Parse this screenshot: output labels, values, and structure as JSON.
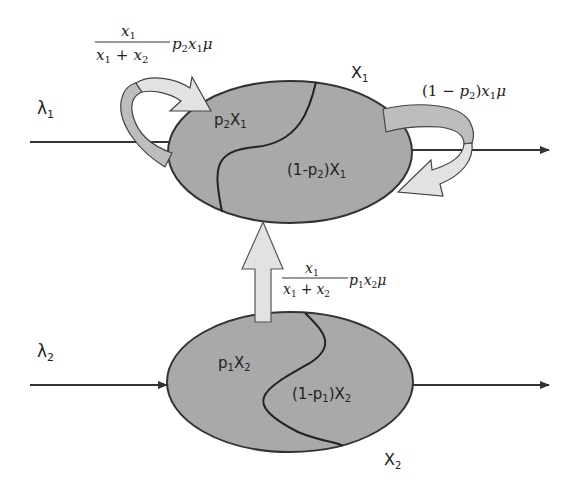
{
  "diagram": {
    "colors": {
      "background": "#ffffff",
      "ellipse_fill": "#a9a9a9",
      "ellipse_stroke": "#333333",
      "arrow_fill_light": "#e2e2e2",
      "arrow_fill_mid": "#bdbdbd",
      "line": "#333333",
      "text": "#222222"
    },
    "queue1": {
      "name": "X",
      "name_sub": "1",
      "arrival_rate": "λ",
      "arrival_sub": "1",
      "region_left": {
        "prefix": "p",
        "prefix_sub": "2",
        "var": "X",
        "var_sub": "1"
      },
      "region_right": {
        "open": "(1-p",
        "p_sub": "2",
        "close": ")X",
        "var_sub": "1"
      }
    },
    "queue2": {
      "name": "X",
      "name_sub": "2",
      "arrival_rate": "λ",
      "arrival_sub": "2",
      "region_left": {
        "prefix": "p",
        "prefix_sub": "1",
        "var": "X",
        "var_sub": "2"
      },
      "region_right": {
        "open": "(1-p",
        "p_sub": "1",
        "close": ")X",
        "var_sub": "2"
      }
    },
    "rates": {
      "self_loop_1": {
        "numerator": "x",
        "numerator_sub": "1",
        "denominator_a": "x",
        "denominator_a_sub": "1",
        "plus": "+",
        "denominator_b": "x",
        "denominator_b_sub": "2",
        "tail_p": "p",
        "tail_p_sub": "2",
        "tail_x": "x",
        "tail_x_sub": "1",
        "tail_mu": "μ"
      },
      "exit_loop_1": {
        "open": "(1 − ",
        "p": "p",
        "p_sub": "2",
        "close": ")",
        "x": "x",
        "x_sub": "1",
        "mu": "μ"
      },
      "transfer_2_to_1": {
        "numerator": "x",
        "numerator_sub": "1",
        "denominator_a": "x",
        "denominator_a_sub": "1",
        "plus": "+",
        "denominator_b": "x",
        "denominator_b_sub": "2",
        "tail_p": "p",
        "tail_p_sub": "1",
        "tail_x": "x",
        "tail_x_sub": "2",
        "tail_mu": "μ"
      }
    }
  }
}
